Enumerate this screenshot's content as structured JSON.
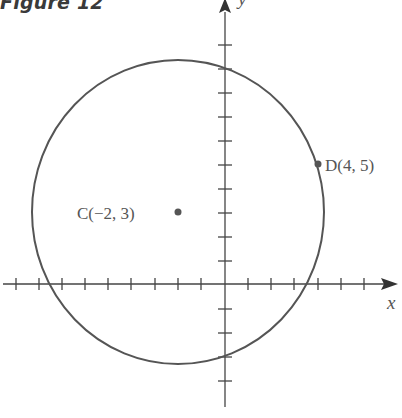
{
  "figure": {
    "title": "Figure 12",
    "axis_x_label": "x",
    "axis_y_label": "y",
    "points": [
      {
        "id": "C",
        "label": "C(−2, 3)",
        "x": -2,
        "y": 3
      },
      {
        "id": "D",
        "label": "D(4, 5)",
        "x": 4,
        "y": 5
      }
    ],
    "circle": {
      "center": [
        -2,
        3
      ],
      "radius_squared": 40
    },
    "colors": {
      "line": "#555555",
      "axis": "#444444",
      "text": "#555555"
    }
  }
}
